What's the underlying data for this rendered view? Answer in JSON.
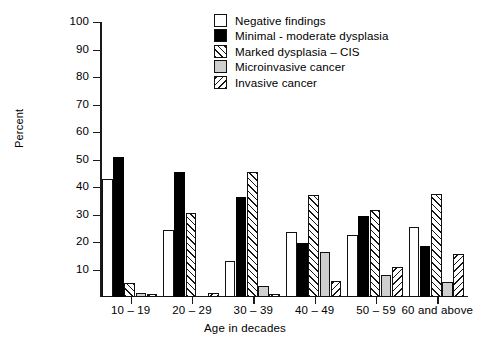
{
  "chart_data": {
    "type": "bar",
    "title": "",
    "xlabel": "Age in decades",
    "ylabel": "Percent",
    "ylim": [
      0,
      100
    ],
    "yticks": [
      10,
      20,
      30,
      40,
      50,
      60,
      70,
      80,
      90,
      100
    ],
    "grid": false,
    "legend_position": "top-right",
    "categories": [
      "10 – 19",
      "20 – 29",
      "30 – 39",
      "40 – 49",
      "50 – 59",
      "60 and above"
    ],
    "series": [
      {
        "name": "Negative findings",
        "pattern": "open",
        "color": "#ffffff",
        "values": [
          43,
          24.5,
          13,
          23.5,
          22.5,
          25.5
        ]
      },
      {
        "name": "Minimal - moderate dysplasia",
        "pattern": "solid-black",
        "color": "#000000",
        "values": [
          51,
          45.5,
          36.5,
          19.5,
          29.5,
          18.5
        ]
      },
      {
        "name": "Marked dysplasia – CIS",
        "pattern": "forward-hatch",
        "color": "#ffffff",
        "values": [
          5,
          30.5,
          45.5,
          37,
          31.5,
          37.5
        ]
      },
      {
        "name": "Microinvasive cancer",
        "pattern": "solid-gray",
        "color": "#cfcfcf",
        "values": [
          1.5,
          0,
          4,
          16.5,
          8,
          5.5
        ]
      },
      {
        "name": "Invasive cancer",
        "pattern": "back-hatch",
        "color": "#ffffff",
        "values": [
          1.2,
          1.5,
          1,
          6,
          11,
          15.5
        ]
      }
    ]
  }
}
